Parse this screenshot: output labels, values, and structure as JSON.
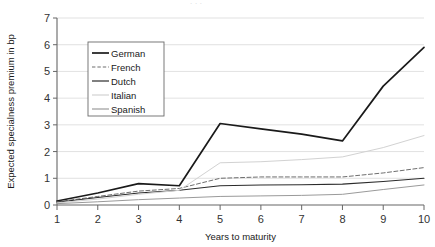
{
  "chart_data": {
    "type": "line",
    "title": "",
    "xlabel": "Years to maturity",
    "ylabel": "Expected specialness premium in bp",
    "x": [
      1,
      2,
      3,
      4,
      5,
      6,
      7,
      8,
      9,
      10
    ],
    "xlim": [
      1,
      10
    ],
    "ylim": [
      0,
      7
    ],
    "yticks": [
      0,
      1,
      2,
      3,
      4,
      5,
      6,
      7
    ],
    "xticks": [
      1,
      2,
      3,
      4,
      5,
      6,
      7,
      8,
      9,
      10
    ],
    "grid": "horizontal",
    "legend_position": "upper-left-inside",
    "series": [
      {
        "name": "German",
        "color": "#1a1a1a",
        "style": "solid",
        "width": 1.7,
        "values": [
          0.15,
          0.45,
          0.8,
          0.72,
          3.05,
          2.85,
          2.65,
          2.4,
          4.45,
          5.9
        ]
      },
      {
        "name": "French",
        "color": "#6e6e6e",
        "style": "dashed",
        "width": 1.0,
        "values": [
          0.12,
          0.32,
          0.52,
          0.62,
          1.0,
          1.05,
          1.05,
          1.05,
          1.2,
          1.4
        ]
      },
      {
        "name": "Dutch",
        "color": "#2b2b2b",
        "style": "solid",
        "width": 1.1,
        "values": [
          0.1,
          0.28,
          0.45,
          0.55,
          0.72,
          0.75,
          0.76,
          0.78,
          0.88,
          1.0
        ]
      },
      {
        "name": "Italian",
        "color": "#d2d2d2",
        "style": "solid",
        "width": 1.0,
        "values": [
          0.08,
          0.22,
          0.4,
          0.55,
          1.58,
          1.62,
          1.7,
          1.8,
          2.15,
          2.6
        ]
      },
      {
        "name": "Spanish",
        "color": "#9a9a9a",
        "style": "solid",
        "width": 1.0,
        "values": [
          0.05,
          0.12,
          0.2,
          0.26,
          0.32,
          0.34,
          0.36,
          0.4,
          0.58,
          0.75
        ]
      }
    ]
  },
  "legend": {
    "items": [
      {
        "label": "German"
      },
      {
        "label": "French"
      },
      {
        "label": "Dutch"
      },
      {
        "label": "Italian"
      },
      {
        "label": "Spanish"
      }
    ]
  },
  "axes": {
    "y_label": "Expected specialness premium in bp",
    "x_label": "Years to maturity"
  }
}
